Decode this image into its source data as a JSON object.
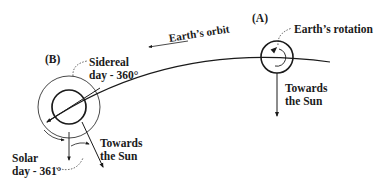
{
  "diagram": {
    "positions": {
      "A": {
        "label": "(A)",
        "rotation_label": "Earth’s rotation",
        "sun_label_line1": "Towards",
        "sun_label_line2": "the Sun"
      },
      "B": {
        "label": "(B)",
        "sidereal_line1": "Sidereal",
        "sidereal_line2": "day - 360°",
        "solar_line1": "Solar",
        "solar_line2": "day - 361°",
        "sun_label_line1": "Towards",
        "sun_label_line2": "the Sun"
      }
    },
    "orbit_label": "Earth’s orbit",
    "colors": {
      "stroke": "#1a1a1a",
      "background": "#ffffff"
    }
  }
}
